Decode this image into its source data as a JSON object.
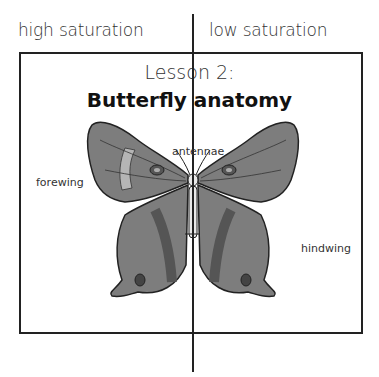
{
  "header": {
    "left_label": "high saturation",
    "right_label": "low saturation"
  },
  "panel": {
    "lesson": "Lesson 2:",
    "title": "Butterfly anatomy"
  },
  "diagram": {
    "labels": {
      "antennae": "antennae",
      "forewing": "forewing",
      "hindwing": "hindwing"
    },
    "colors": {
      "wing_dark": "#5a5a5a",
      "wing_mid": "#7d7d7d",
      "wing_light": "#b5b5b5",
      "outline": "#222222",
      "body": "#e8e8e8"
    }
  }
}
